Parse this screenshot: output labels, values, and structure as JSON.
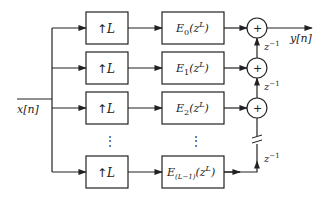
{
  "diagram": {
    "type": "polyphase-interpolator-block-diagram",
    "input_label": "x[n]",
    "output_label": "y[n]",
    "upsampler_label": "L",
    "upsampler_arrow": "↑",
    "branches": [
      {
        "filter": "E",
        "sub": "0",
        "arg": "(z",
        "sup": "L",
        "close": ")"
      },
      {
        "filter": "E",
        "sub": "1",
        "arg": "(z",
        "sup": "L",
        "close": ")"
      },
      {
        "filter": "E",
        "sub": "2",
        "arg": "(z",
        "sup": "L",
        "close": ")"
      },
      {
        "filter": "E",
        "sub": "(L−1)",
        "arg": "(z",
        "sup": "L",
        "close": ")"
      }
    ],
    "delay_label": {
      "base": "z",
      "sup": "−1"
    },
    "adder_symbol": "+",
    "ellipsis": "⋮",
    "colors": {
      "line": "#222222",
      "background": "#ffffff"
    }
  }
}
